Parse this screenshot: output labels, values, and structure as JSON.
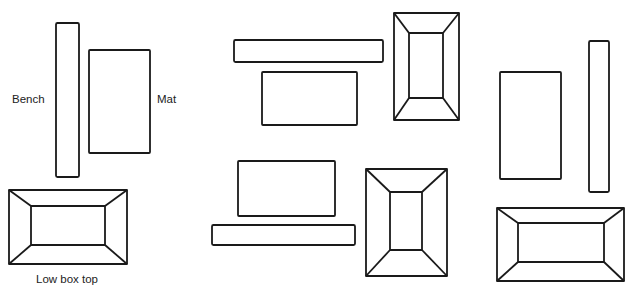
{
  "labels": {
    "bench": "Bench",
    "mat": "Mat",
    "low_box_top": "Low box top"
  },
  "colors": {
    "stroke": "#1a1a1a",
    "text": "#222222",
    "background": "#ffffff"
  },
  "arrangements": [
    {
      "name": "arrangement-1",
      "bench": {
        "x": 56,
        "y": 23,
        "w": 23,
        "h": 154,
        "orientation": "vertical"
      },
      "mat": {
        "x": 89,
        "y": 50,
        "w": 61,
        "h": 103
      },
      "box": {
        "outer": {
          "x": 9,
          "y": 190,
          "w": 118,
          "h": 74
        },
        "inner": {
          "x": 31,
          "y": 206,
          "w": 74,
          "h": 39
        }
      }
    },
    {
      "name": "arrangement-2",
      "bench": {
        "x": 234,
        "y": 40,
        "w": 149,
        "h": 22,
        "orientation": "horizontal"
      },
      "mat": {
        "x": 262,
        "y": 72,
        "w": 95,
        "h": 53
      },
      "box": {
        "outer": {
          "x": 394,
          "y": 13,
          "w": 65,
          "h": 107
        },
        "inner": {
          "x": 409,
          "y": 33,
          "w": 34,
          "h": 65
        }
      }
    },
    {
      "name": "arrangement-3",
      "bench": {
        "x": 212,
        "y": 225,
        "w": 143,
        "h": 20,
        "orientation": "horizontal"
      },
      "mat": {
        "x": 238,
        "y": 161,
        "w": 97,
        "h": 55
      },
      "box": {
        "outer": {
          "x": 366,
          "y": 169,
          "w": 81,
          "h": 107
        },
        "inner": {
          "x": 390,
          "y": 192,
          "w": 32,
          "h": 58
        }
      }
    },
    {
      "name": "arrangement-4",
      "bench": {
        "x": 589,
        "y": 41,
        "w": 20,
        "h": 151,
        "orientation": "vertical"
      },
      "mat": {
        "x": 500,
        "y": 72,
        "w": 61,
        "h": 107
      },
      "box": {
        "outer": {
          "x": 497,
          "y": 208,
          "w": 127,
          "h": 73
        },
        "inner": {
          "x": 518,
          "y": 223,
          "w": 86,
          "h": 39
        }
      }
    }
  ]
}
